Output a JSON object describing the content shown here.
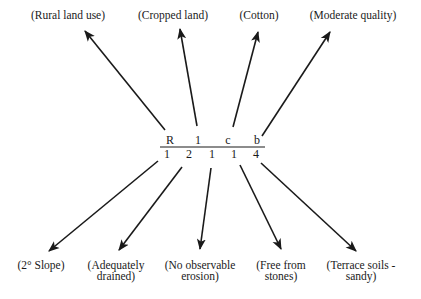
{
  "diagram": {
    "title": "",
    "code": {
      "numerator": [
        "R",
        "1",
        "c",
        "b"
      ],
      "denominator": [
        "1",
        "2",
        "1",
        "1",
        "4"
      ]
    },
    "top_labels": [
      {
        "text": "(Rural land use)",
        "x": 68,
        "y": 10
      },
      {
        "text": "(Cropped land)",
        "x": 173,
        "y": 10
      },
      {
        "text": "(Cotton)",
        "x": 259,
        "y": 10
      },
      {
        "text": "(Moderate quality)",
        "x": 353,
        "y": 10
      }
    ],
    "bottom_labels": [
      {
        "line1": "(2° Slope)",
        "line2": "",
        "x": 41,
        "y": 260
      },
      {
        "line1": "(Adequately",
        "line2": "drained)",
        "x": 116,
        "y": 260
      },
      {
        "line1": "(No observable",
        "line2": "erosion)",
        "x": 200,
        "y": 260
      },
      {
        "line1": "(Free from",
        "line2": "stones)",
        "x": 281,
        "y": 260
      },
      {
        "line1": "(Terrace soils -",
        "line2": "sandy)",
        "x": 361,
        "y": 260
      }
    ],
    "colors": {
      "ink": "#1a1a1a",
      "background": "#ffffff"
    }
  }
}
